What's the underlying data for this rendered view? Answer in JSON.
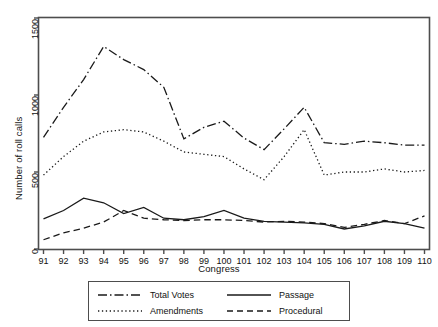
{
  "chart_data": {
    "type": "line",
    "title": "",
    "xlabel": "Congress",
    "ylabel": "Number of roll calls",
    "xlim": [
      91,
      110
    ],
    "ylim": [
      0,
      1500
    ],
    "yticks": [
      0,
      500,
      1000,
      1500
    ],
    "ytick_labels": [
      "0",
      "500",
      "1000",
      "1500"
    ],
    "grid": false,
    "legend_position": "below-center",
    "x": [
      91,
      92,
      93,
      94,
      95,
      96,
      97,
      98,
      99,
      100,
      101,
      102,
      103,
      104,
      105,
      106,
      107,
      108,
      109,
      110
    ],
    "xtick_labels": [
      "91",
      "92",
      "93",
      "94",
      "95",
      "96",
      "97",
      "98",
      "99",
      "100",
      "101",
      "102",
      "103",
      "104",
      "105",
      "106",
      "107",
      "108",
      "109",
      "110"
    ],
    "series": [
      {
        "name": "Total Votes",
        "dash": "dash-dot",
        "values": [
          725,
          920,
          1100,
          1315,
          1230,
          1165,
          1050,
          715,
          790,
          830,
          720,
          645,
          780,
          920,
          690,
          680,
          700,
          690,
          675,
          675
        ]
      },
      {
        "name": "Amendments",
        "dash": "dotted",
        "values": [
          480,
          600,
          700,
          760,
          775,
          760,
          700,
          630,
          615,
          600,
          520,
          450,
          600,
          775,
          480,
          500,
          500,
          520,
          500,
          510
        ]
      },
      {
        "name": "Passage",
        "dash": "solid",
        "values": [
          195,
          250,
          330,
          300,
          230,
          270,
          200,
          190,
          210,
          250,
          200,
          180,
          175,
          170,
          160,
          130,
          150,
          180,
          165,
          135
        ]
      },
      {
        "name": "Procedural",
        "dash": "dashed",
        "values": [
          60,
          105,
          135,
          175,
          250,
          200,
          190,
          185,
          190,
          190,
          185,
          175,
          180,
          175,
          165,
          140,
          160,
          185,
          165,
          215
        ]
      }
    ]
  },
  "legend": {
    "entries": [
      {
        "label": "Total Votes",
        "key": "dashdot-line-key"
      },
      {
        "label": "Passage",
        "key": "solid-line-key"
      },
      {
        "label": "Amendments",
        "key": "dotted-line-key"
      },
      {
        "label": "Procedural",
        "key": "dashed-line-key"
      }
    ]
  },
  "style": {
    "line_color": "#1a1a1a",
    "axis_color": "#4d4d4d",
    "background": "#ffffff"
  }
}
